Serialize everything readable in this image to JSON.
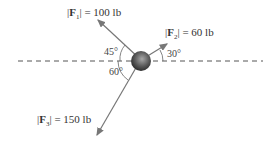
{
  "diagram": {
    "type": "force-diagram",
    "forces": [
      {
        "name": "F1",
        "label_prefix": "|",
        "symbol": "F",
        "sub": "1",
        "label_suffix": "| = 100 lb",
        "magnitude": "100 lb",
        "angle_label": "45°",
        "reference": "horizontal, left, above"
      },
      {
        "name": "F2",
        "label_prefix": "|",
        "symbol": "F",
        "sub": "2",
        "label_suffix": "| = 60 lb",
        "magnitude": "60 lb",
        "angle_label": "30°",
        "reference": "horizontal, right, above"
      },
      {
        "name": "F3",
        "label_prefix": "|",
        "symbol": "F",
        "sub": "3",
        "label_suffix": "| = 150 lb",
        "magnitude": "150 lb",
        "angle_label": "60°",
        "reference": "horizontal, left, below"
      }
    ],
    "colors": {
      "arrow": "#777777",
      "dashed_line": "#555555",
      "sphere_dark": "#333333",
      "sphere_light": "#9a9a9a"
    }
  }
}
